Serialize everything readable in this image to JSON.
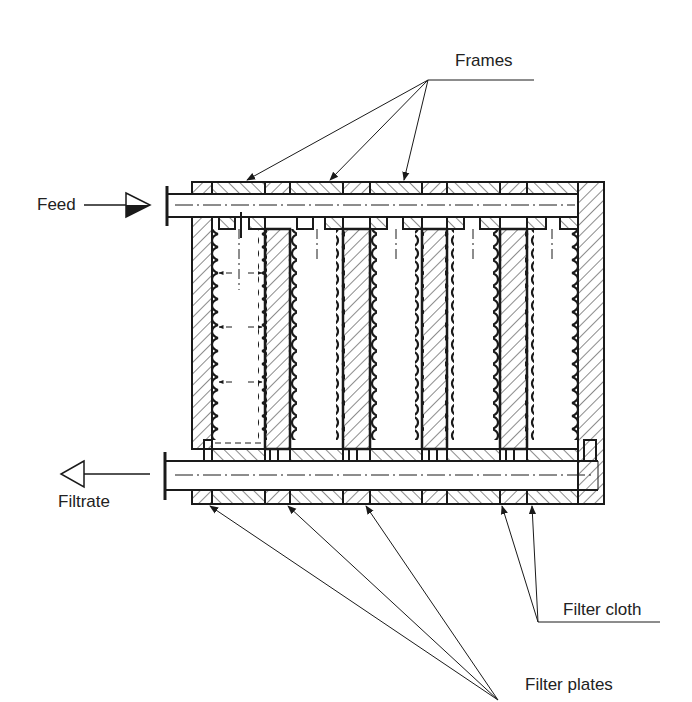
{
  "diagram": {
    "labels": {
      "frames": "Frames",
      "feed": "Feed",
      "filtrate": "Filtrate",
      "filter_cloth": "Filter cloth",
      "filter_plates": "Filter plates"
    },
    "colors": {
      "ink": "#1a1a1a",
      "background": "#ffffff"
    },
    "components": {
      "frames_pointed": 3,
      "filter_plates_pointed": 3,
      "filter_cloth_pointed": 2,
      "chambers": 6
    },
    "flows": [
      {
        "name": "feed",
        "direction": "in",
        "channel": "top"
      },
      {
        "name": "filtrate",
        "direction": "out",
        "channel": "bottom"
      }
    ]
  }
}
